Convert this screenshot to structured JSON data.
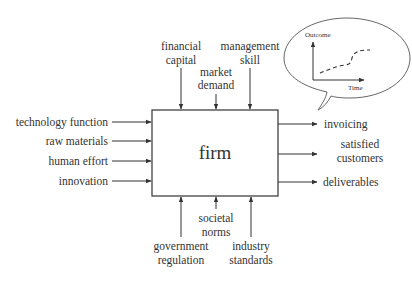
{
  "diagram": {
    "center": {
      "label": "firm"
    },
    "inputs_left": [
      {
        "label": "technology function"
      },
      {
        "label": "raw materials"
      },
      {
        "label": "human effort"
      },
      {
        "label": "innovation"
      }
    ],
    "inputs_top": [
      {
        "line1": "financial",
        "line2": "capital"
      },
      {
        "line1": "market",
        "line2": "demand"
      },
      {
        "line1": "management",
        "line2": "skill"
      }
    ],
    "inputs_bottom": [
      {
        "line1": "government",
        "line2": "regulation"
      },
      {
        "line1": "societal",
        "line2": "norms"
      },
      {
        "line1": "industry",
        "line2": "standards"
      }
    ],
    "outputs_right": [
      {
        "line1": "invoicing",
        "line2": ""
      },
      {
        "line1": "satisfied",
        "line2": "customers"
      },
      {
        "line1": "deliverables",
        "line2": ""
      }
    ],
    "bubble": {
      "y_axis_label": "Outcome",
      "x_axis_label": "Time"
    }
  }
}
